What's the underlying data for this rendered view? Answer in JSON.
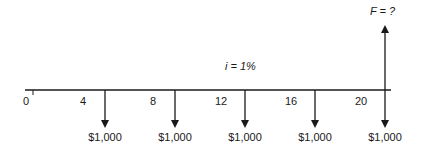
{
  "diagram": {
    "type": "cash-flow-diagram",
    "interest_label": "i = 1%",
    "future_value_label": "F = ?",
    "zero_label": "0",
    "period_ticks": [
      {
        "label": "4",
        "x": 82
      },
      {
        "label": "8",
        "x": 152
      },
      {
        "label": "12",
        "x": 218
      },
      {
        "label": "16",
        "x": 288
      },
      {
        "label": "20",
        "x": 358
      }
    ],
    "payments": [
      {
        "label": "$1,000",
        "x": 105,
        "direction": "down"
      },
      {
        "label": "$1,000",
        "x": 175,
        "direction": "down"
      },
      {
        "label": "$1,000",
        "x": 245,
        "direction": "down"
      },
      {
        "label": "$1,000",
        "x": 315,
        "direction": "down"
      },
      {
        "label": "$1,000",
        "x": 385,
        "direction": "down"
      }
    ],
    "future_value_x": 385,
    "line_color": "#1a1a1a"
  }
}
